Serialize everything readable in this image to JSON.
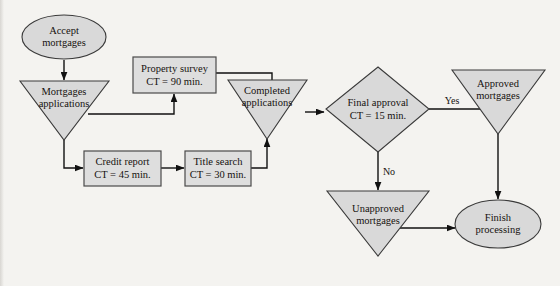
{
  "diagram": {
    "background_color": "#f4f3f0",
    "shape_fill": "#d9d9d9",
    "shape_stroke": "#3a3a3a",
    "connector_color": "#111111",
    "nodes": [
      {
        "id": "accept",
        "type": "ellipse",
        "line1": "Accept",
        "line2": "mortgages"
      },
      {
        "id": "mortgages",
        "type": "triangle",
        "line1": "Mortgages",
        "line2": "applications"
      },
      {
        "id": "property",
        "type": "box",
        "line1": "Property survey",
        "line2": "CT = 90 min."
      },
      {
        "id": "credit",
        "type": "box",
        "line1": "Credit report",
        "line2": "CT = 45 min."
      },
      {
        "id": "title",
        "type": "box",
        "line1": "Title search",
        "line2": "CT = 30 min."
      },
      {
        "id": "completed",
        "type": "triangle",
        "line1": "Completed",
        "line2": "applications"
      },
      {
        "id": "final",
        "type": "diamond",
        "line1": "Final approval",
        "line2": "CT = 15 min."
      },
      {
        "id": "approved",
        "type": "triangle",
        "line1": "Approved",
        "line2": "mortgages"
      },
      {
        "id": "unapproved",
        "type": "triangle",
        "line1": "Unapproved",
        "line2": "mortgages"
      },
      {
        "id": "finish",
        "type": "ellipse",
        "line1": "Finish",
        "line2": "processing"
      }
    ],
    "edge_labels": {
      "yes": "Yes",
      "no": "No"
    }
  }
}
